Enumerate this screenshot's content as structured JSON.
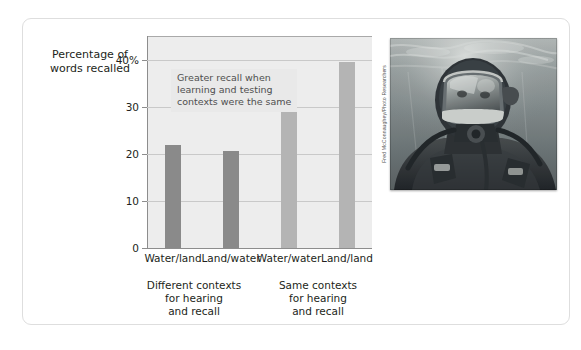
{
  "figure": {
    "y_axis_title_line1": "Percentage of",
    "y_axis_title_line2": "words recalled",
    "annotation_line1": "Greater recall when",
    "annotation_line2": "learning and testing",
    "annotation_line3": "contexts were the same",
    "group_left_line1": "Different contexts",
    "group_left_line2": "for hearing",
    "group_left_line3": "and recall",
    "group_right_line1": "Same contexts",
    "group_right_line2": "for hearing",
    "group_right_line3": "and recall",
    "photo_credit": "Fred McConnaughey/Photo Researchers",
    "photo_alt": "scuba-diver-underwater"
  },
  "colors": {
    "bar_dark": "#8a8a8a",
    "bar_light": "#b4b4b4",
    "plot_background": "#ededed",
    "gridline": "#c9c9c9",
    "annotation_background": "#e9e9e9",
    "card_border": "#dedede"
  },
  "chart_data": {
    "type": "bar",
    "title": "",
    "xlabel": "",
    "ylabel": "Percentage of words recalled",
    "categories": [
      "Water/land",
      "Land/water",
      "Water/water",
      "Land/land"
    ],
    "values": [
      21.8,
      20.6,
      30.5,
      39.5
    ],
    "bar_colors": [
      "#8a8a8a",
      "#8a8a8a",
      "#b4b4b4",
      "#b4b4b4"
    ],
    "ylim": [
      0,
      45
    ],
    "yticks": [
      0,
      10,
      20,
      30,
      40
    ],
    "ytick_labels": [
      "0",
      "10",
      "20",
      "30",
      "40%"
    ],
    "grid": true,
    "legend": "none",
    "groups": [
      {
        "label": "Different contexts for hearing and recall",
        "categories": [
          "Water/land",
          "Land/water"
        ]
      },
      {
        "label": "Same contexts for hearing and recall",
        "categories": [
          "Water/water",
          "Land/land"
        ]
      }
    ],
    "annotations": [
      {
        "text": "Greater recall when learning and testing contexts were the same"
      }
    ]
  }
}
